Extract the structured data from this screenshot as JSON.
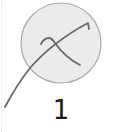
{
  "gesture_tile": {
    "index_label": "1",
    "icon": "gesture-stroke-icon",
    "colors": {
      "circle_fill": "#ebebeb",
      "circle_border": "#a9a9a9",
      "stroke": "#6a6a6a",
      "label": "#1c1c1c"
    }
  }
}
